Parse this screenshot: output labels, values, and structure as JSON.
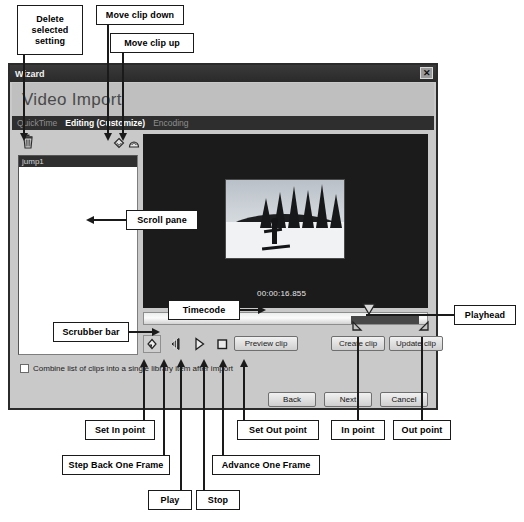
{
  "window": {
    "title": "Wizard",
    "close_icon": "close-icon",
    "banner_title": "Video Import"
  },
  "tabs": [
    {
      "label": "QuickTime",
      "active": false
    },
    {
      "label": "Editing (Customize)",
      "active": true
    },
    {
      "label": "Encoding",
      "active": false
    }
  ],
  "list_toolbar": [
    {
      "name": "delete-selected-setting-icon",
      "label": "trash-icon"
    },
    {
      "name": "move-clip-down-icon",
      "label": "diamond-down-icon"
    },
    {
      "name": "move-clip-up-icon",
      "label": "diamond-up-icon"
    }
  ],
  "clip_list": {
    "items": [
      {
        "label": "jump1",
        "selected": true
      }
    ]
  },
  "preview": {
    "timecode": "00:00:16.855"
  },
  "transport": [
    {
      "name": "set-in-point-button",
      "icon": "diamond-in-icon",
      "selected": true
    },
    {
      "name": "step-back-one-frame-button",
      "icon": "step-back-icon",
      "selected": false
    },
    {
      "name": "play-button",
      "icon": "play-icon",
      "selected": false
    },
    {
      "name": "stop-button",
      "icon": "stop-icon",
      "selected": false
    },
    {
      "name": "advance-one-frame-button",
      "icon": "advance-frame-icon",
      "selected": false
    },
    {
      "name": "set-out-point-button",
      "icon": "diamond-out-icon",
      "selected": false
    }
  ],
  "buttons": {
    "preview_clip": "Preview clip",
    "create_clip": "Create clip",
    "update_clip": "Update clip",
    "back": "Back",
    "next": "Next",
    "cancel": "Cancel"
  },
  "combine_option": {
    "label": "Combine list of clips into a single library item after import",
    "checked": false
  },
  "annotations": {
    "delete_selected_setting": "Delete\nselected\nsetting",
    "delete_selected_setting_lines": [
      "Delete",
      "selected",
      "setting"
    ],
    "move_clip_down": "Move clip down",
    "move_clip_up": "Move clip up",
    "scroll_pane": "Scroll pane",
    "scrubber_bar": "Scrubber bar",
    "timecode": "Timecode",
    "playhead": "Playhead",
    "set_in_point": "Set In point",
    "step_back_one_frame": "Step Back One Frame",
    "play": "Play",
    "stop": "Stop",
    "advance_one_frame": "Advance One Frame",
    "set_out_point": "Set Out point",
    "in_point": "In point",
    "out_point": "Out point"
  },
  "colors": {
    "dialog_bg": "#c9c9c9",
    "titlebar": "#2e2e2e",
    "video_bg": "#1b1b1b",
    "selection": "#474747"
  }
}
